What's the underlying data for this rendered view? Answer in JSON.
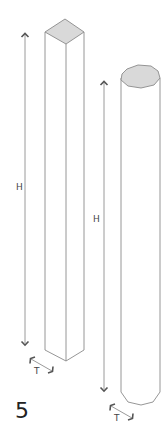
{
  "figure": {
    "number": "5",
    "colors": {
      "outline": "#8a8a8a",
      "cap_fill": "#d9d9d9",
      "arrow": "#9a9a9a",
      "arrow_head": "#555555",
      "text": "#444444"
    }
  },
  "square_prism": {
    "height_label": "H",
    "thickness_label": "T"
  },
  "octagonal_prism": {
    "height_label": "H",
    "thickness_label": "T"
  }
}
